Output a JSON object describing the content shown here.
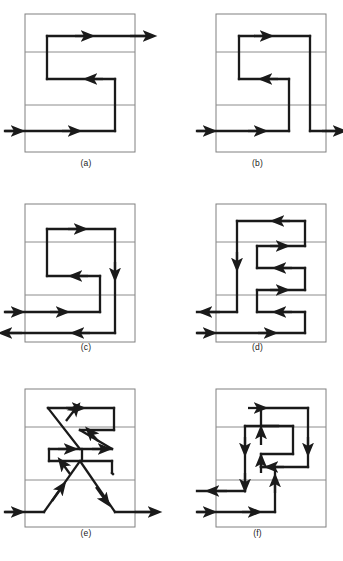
{
  "figure": {
    "type": "technical-diagram",
    "background_color": "#ffffff",
    "shell_color": "#808080",
    "baffle_color": "#8c8c8c",
    "flow_color": "#1a1a1a",
    "panel_count": 6
  },
  "panels": [
    {
      "id": "a",
      "caption": "(a)",
      "shell": {
        "x": 25,
        "y": 14,
        "width": 110,
        "height": 138
      },
      "baffles": [
        52,
        105
      ],
      "passes": 2,
      "inlets": [
        {
          "side": "left",
          "y": 131
        }
      ],
      "outlets": [
        {
          "side": "right",
          "y": 36
        }
      ],
      "path_name": "s-shaped-two-pass"
    },
    {
      "id": "b",
      "caption": "(b)",
      "shell": {
        "x": 216,
        "y": 14,
        "width": 110,
        "height": 138
      },
      "baffles": [
        52,
        105
      ],
      "passes": 2,
      "inlets": [
        {
          "side": "left",
          "y": 131
        }
      ],
      "outlets": [
        {
          "side": "right",
          "y": 131
        }
      ],
      "path_name": "s-shaped-return-to-same-end"
    },
    {
      "id": "c",
      "caption": "(c)",
      "shell": {
        "x": 25,
        "y": 204,
        "width": 110,
        "height": 138
      },
      "baffles": [
        242,
        295
      ],
      "passes": 3,
      "inlets": [
        {
          "side": "left",
          "y": 312
        }
      ],
      "outlets": [
        {
          "side": "left",
          "y": 333
        }
      ],
      "path_name": "s-shaped-three-pass-same-side"
    },
    {
      "id": "d",
      "caption": "(d)",
      "shell": {
        "x": 216,
        "y": 204,
        "width": 110,
        "height": 138
      },
      "baffles": [
        242,
        295
      ],
      "passes": 5,
      "inlets": [
        {
          "side": "left",
          "y": 333
        }
      ],
      "outlets": [
        {
          "side": "left",
          "y": 312
        }
      ],
      "path_name": "comb-shaped-multipass"
    },
    {
      "id": "e",
      "caption": "(e)",
      "shell": {
        "x": 25,
        "y": 390,
        "width": 110,
        "height": 138
      },
      "baffles": [
        428,
        481
      ],
      "passes": 3,
      "crossings": 2,
      "inlets": [
        {
          "side": "left",
          "y": 512
        }
      ],
      "outlets": [
        {
          "side": "right",
          "y": 512
        }
      ],
      "path_name": "crossed-diagonal-flow"
    },
    {
      "id": "f",
      "caption": "(f)",
      "shell": {
        "x": 216,
        "y": 390,
        "width": 110,
        "height": 138
      },
      "baffles": [
        428,
        481
      ],
      "passes": 4,
      "inlets": [
        {
          "side": "left",
          "y": 512
        }
      ],
      "outlets": [
        {
          "side": "left",
          "y": 491
        }
      ],
      "path_name": "nested-spiral-flow"
    }
  ]
}
